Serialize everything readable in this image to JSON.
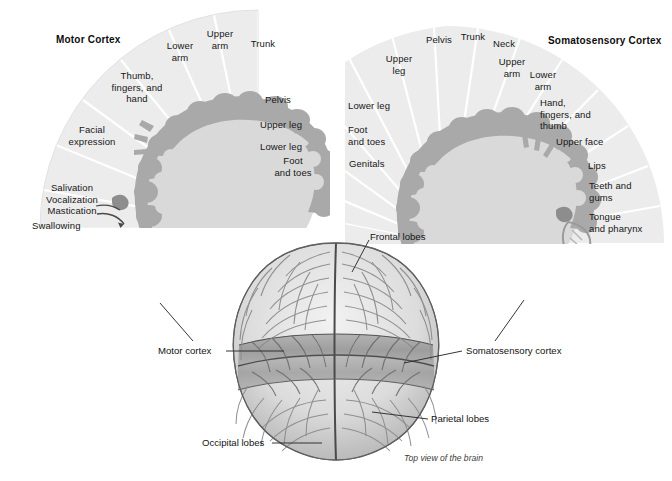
{
  "figure": {
    "caption": "Top view of the brain"
  },
  "motor": {
    "title": "Motor Cortex",
    "sectors": [
      {
        "label": "Trunk"
      },
      {
        "label": "Upper\narm"
      },
      {
        "label": "Lower\narm"
      },
      {
        "label": "Thumb,\nfingers, and\nhand"
      },
      {
        "label": "Facial\nexpression"
      },
      {
        "label": "Salivation\nVocalization\nMastication"
      },
      {
        "label": "Swallowing"
      },
      {
        "label": "Pelvis"
      },
      {
        "label": "Upper leg"
      },
      {
        "label": "Lower leg"
      },
      {
        "label": "Foot\nand toes"
      }
    ]
  },
  "somatosensory": {
    "title": "Somatosensory Cortex",
    "sectors": [
      {
        "label": "Genitals"
      },
      {
        "label": "Foot\nand toes"
      },
      {
        "label": "Lower leg"
      },
      {
        "label": "Upper\nleg"
      },
      {
        "label": "Pelvis"
      },
      {
        "label": "Trunk"
      },
      {
        "label": "Neck"
      },
      {
        "label": "Upper\narm"
      },
      {
        "label": "Lower\narm"
      },
      {
        "label": "Hand,\nfingers, and\nthumb"
      },
      {
        "label": "Upper face"
      },
      {
        "label": "Lips"
      },
      {
        "label": "Teeth and\ngums"
      },
      {
        "label": "Tongue\nand pharynx"
      }
    ]
  },
  "brain": {
    "callouts": [
      {
        "name": "frontal-lobes",
        "label": "Frontal lobes"
      },
      {
        "name": "motor-cortex",
        "label": "Motor cortex"
      },
      {
        "name": "somatosensory-cortex",
        "label": "Somatosensory cortex"
      },
      {
        "name": "parietal-lobes",
        "label": "Parietal lobes"
      },
      {
        "name": "occipital-lobes",
        "label": "Occipital lobes"
      }
    ]
  },
  "colors": {
    "fan_fill": "#ececec",
    "fan_divider": "#ffffff",
    "cortex_ribbon": "#a9a9a9",
    "cortex_inner": "#d8d8d8",
    "brain_light": "#e4e4e4",
    "brain_band": "#9e9e9e",
    "leader_line": "#2b2b2b",
    "text": "#171717"
  }
}
